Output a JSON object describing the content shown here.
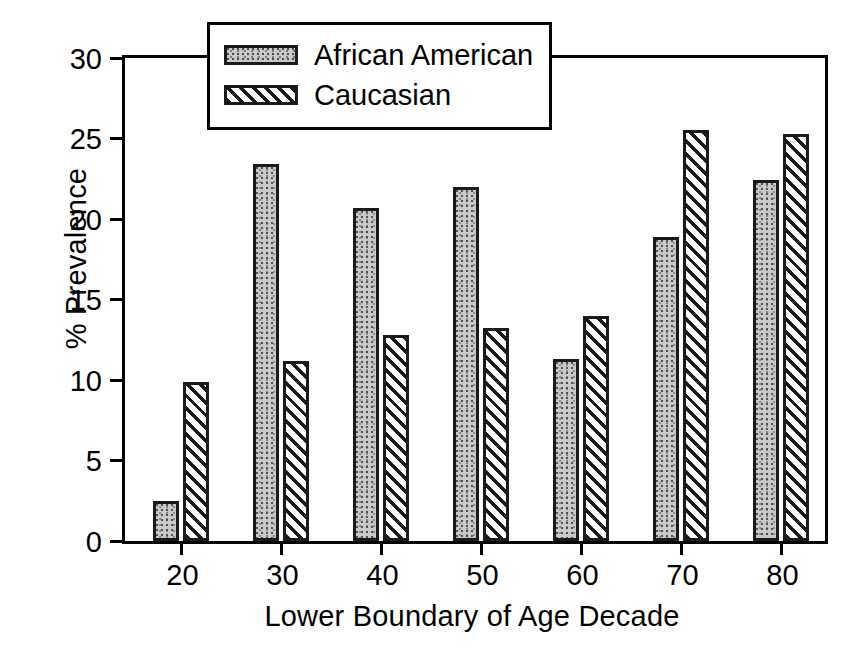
{
  "chart_data": {
    "type": "bar",
    "title": "",
    "subtitle": "",
    "xlabel": "Lower Boundary of Age Decade",
    "ylabel": "% Prevalence",
    "categories": [
      "20",
      "30",
      "40",
      "50",
      "60",
      "70",
      "80"
    ],
    "series": [
      {
        "name": "African American",
        "pattern": "stipple",
        "values": [
          2.5,
          23.4,
          20.7,
          22.0,
          11.3,
          18.9,
          22.4
        ]
      },
      {
        "name": "Caucasian",
        "pattern": "diagonal-hatch",
        "values": [
          9.9,
          11.2,
          12.8,
          13.2,
          14.0,
          25.5,
          25.3
        ]
      }
    ],
    "ylim": [
      0,
      30
    ],
    "yticks": [
      0,
      5,
      10,
      15,
      20,
      25,
      30
    ],
    "ytick_labels": [
      "0",
      "5",
      "10",
      "15",
      "20",
      "25",
      "30"
    ],
    "xtick_labels": [
      "20",
      "30",
      "40",
      "50",
      "60",
      "70",
      "80"
    ],
    "grid": false,
    "legend_position": "top-center",
    "colors": {
      "axis": "#000000",
      "bar_edge": "#1a1a1a",
      "series_0_fill": "#c9c9c9",
      "series_1_fill": "#ffffff",
      "background": "#ffffff"
    }
  },
  "legend": {
    "entries": [
      {
        "label": "African American"
      },
      {
        "label": "Caucasian"
      }
    ]
  },
  "axes": {
    "y_title": "% Prevalence",
    "x_title": "Lower Boundary of Age Decade"
  }
}
